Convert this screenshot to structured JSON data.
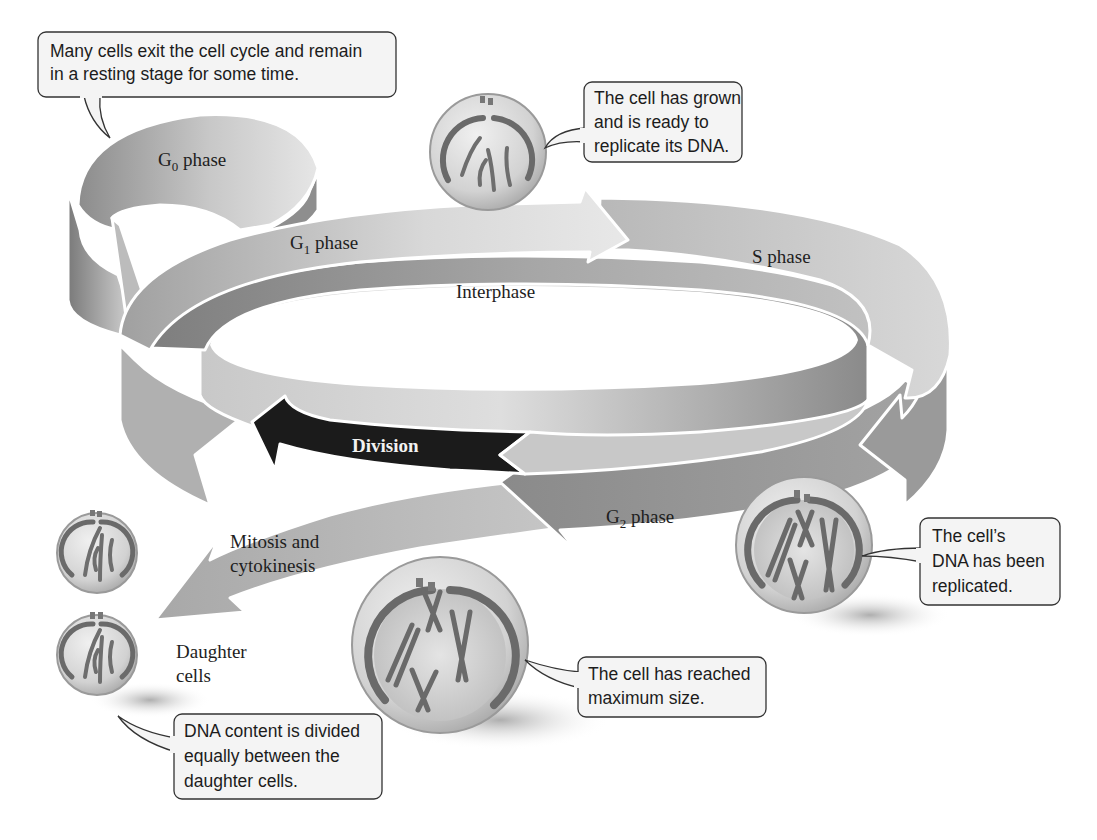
{
  "diagram": {
    "title": "The cell cycle",
    "phases": {
      "g0": {
        "prefix": "G",
        "subscript": "0",
        "suffix": " phase"
      },
      "g1": {
        "prefix": "G",
        "subscript": "1",
        "suffix": " phase"
      },
      "s": {
        "label": "S phase"
      },
      "g2": {
        "prefix": "G",
        "subscript": "2",
        "suffix": " phase"
      },
      "interphase": {
        "label": "Interphase"
      },
      "division": {
        "label": "Division"
      },
      "mitosis": {
        "line1": "Mitosis and",
        "line2": "cytokinesis"
      },
      "daughter": {
        "line1": "Daughter",
        "line2": "cells"
      }
    },
    "callouts": {
      "resting": {
        "line1": "Many cells exit the cell cycle and remain",
        "line2": "in a resting stage for some time."
      },
      "grown": {
        "line1": "The cell has grown",
        "line2": "and is ready to",
        "line3": "replicate its DNA."
      },
      "replicated": {
        "line1": "The cell’s",
        "line2": "DNA has been",
        "line3": "replicated."
      },
      "max_size": {
        "line1": "The cell has reached",
        "line2": "maximum size."
      },
      "divided": {
        "line1": "DNA content is divided",
        "line2": "equally between the",
        "line3": "daughter cells."
      }
    },
    "colors": {
      "band_light": "#d6d6d6",
      "band_mid": "#a8a8a8",
      "band_dark": "#7c7c7c",
      "division": "#1a1a1a",
      "callout_fill": "#f4f4f4"
    }
  }
}
